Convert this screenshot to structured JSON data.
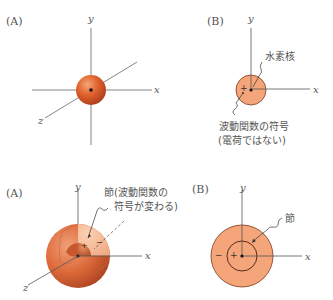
{
  "panels": {
    "top_a": {
      "label": "(A)",
      "axes": {
        "x": "x",
        "y": "y",
        "z": "z"
      }
    },
    "top_b": {
      "label": "(B)",
      "axes": {
        "x": "x",
        "y": "y"
      },
      "sign": "+",
      "annotations": {
        "nucleus": "水素核",
        "sign_line1": "波動関数の符号",
        "sign_line2": "(電荷ではない)"
      }
    },
    "bottom_a": {
      "label": "(A)",
      "axes": {
        "x": "x",
        "y": "y",
        "z": "z"
      },
      "signs": {
        "inner": "+",
        "outer": "−"
      },
      "annotations": {
        "node_line1": "節(波動関数の",
        "node_line2": "符号が変わる)"
      }
    },
    "bottom_b": {
      "label": "(B)",
      "axes": {
        "x": "x",
        "y": "y"
      },
      "signs": {
        "inner": "+",
        "outer": "−"
      },
      "annotations": {
        "node": "節"
      }
    }
  },
  "colors": {
    "sphere_dark": "#b8431a",
    "sphere_mid": "#e06a35",
    "sphere_light": "#f5a070",
    "disk_fill": "#f4a57a",
    "axis": "#666666",
    "outline": "#7a2e10"
  }
}
